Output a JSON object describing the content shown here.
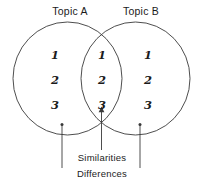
{
  "figure": {
    "type": "venn-diagram",
    "stroke_color": "#3a3a3a",
    "text_color": "#1b1b1b",
    "background_color": "#ffffff"
  },
  "circles": {
    "left": {
      "label": "Topic A"
    },
    "right": {
      "label": "Topic B"
    }
  },
  "items": {
    "left_only": [
      "1",
      "2",
      "3"
    ],
    "intersection": [
      "1",
      "2",
      "3"
    ],
    "right_only": [
      "1",
      "2",
      "3"
    ]
  },
  "callouts": {
    "similarities": "Similarities",
    "differences": "Differences"
  }
}
